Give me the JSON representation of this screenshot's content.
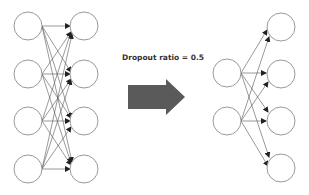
{
  "diagram": {
    "label": "Dropout ratio = 0.5",
    "colors": {
      "node_stroke": "#9a9a9a",
      "edge": "#555555",
      "arrow_fill": "#5a5a5a",
      "text": "#333333"
    },
    "before": {
      "input_nodes": 4,
      "output_nodes": 4,
      "connections": "fully-connected (16 edges)"
    },
    "after": {
      "input_nodes": 2,
      "output_nodes": 4,
      "connections": "fully-connected (8 edges)"
    }
  }
}
